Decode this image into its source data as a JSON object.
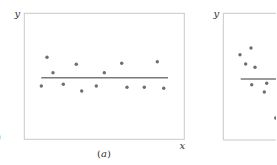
{
  "figure": {
    "panels": [
      {
        "id": "a",
        "caption_open": "(",
        "caption_letter": "a",
        "caption_close": ")",
        "x_axis_label": "x",
        "y_axis_label": "y"
      },
      {
        "id": "b",
        "y_axis_label": "y"
      }
    ],
    "left_edge_fragment": ")"
  },
  "colors": {
    "frame": "#c8c8c8",
    "points": "#6e6e6e",
    "line": "#7a7a7a",
    "text": "#333333"
  },
  "chart_data": [
    {
      "type": "scatter",
      "title": "(a)",
      "xlabel": "x",
      "ylabel": "y",
      "grid": false,
      "ticks": false,
      "description": "Points scattered randomly above and below a horizontal fitted line (no pattern)",
      "points_px": [
        [
          41.3,
          86
        ],
        [
          47,
          57.3
        ],
        [
          53,
          72.7
        ],
        [
          63.3,
          84.3
        ],
        [
          76.3,
          64.3
        ],
        [
          81.7,
          91
        ],
        [
          96.3,
          86
        ],
        [
          104.3,
          72.7
        ],
        [
          121.7,
          63.3
        ],
        [
          127,
          87.3
        ],
        [
          144.3,
          87.3
        ],
        [
          157.3,
          61.7
        ],
        [
          163.7,
          88.3
        ]
      ],
      "line_px": {
        "x1": 41.3,
        "x2": 168,
        "y": 77.7
      },
      "frame_px": {
        "left": 24.3,
        "top": 13.3,
        "right": 184.3,
        "bottom": 139.3
      }
    },
    {
      "type": "scatter",
      "title": "(b)",
      "xlabel": "x",
      "ylabel": "y",
      "grid": false,
      "ticks": false,
      "description": "Points above the line on the left and trending below it toward the right (systematic pattern); panel cropped at right edge",
      "points_px": [
        [
          240,
          54.7
        ],
        [
          251,
          48
        ],
        [
          245.7,
          64
        ],
        [
          255,
          67.3
        ],
        [
          251.7,
          84.7
        ],
        [
          266.7,
          83.3
        ],
        [
          264.3,
          92
        ],
        [
          275.7,
          118
        ]
      ],
      "line_px": {
        "x1": 240.7,
        "x2": 276,
        "y": 79
      },
      "frame_px": {
        "left": 223.3,
        "top": 13.3,
        "right": 276,
        "bottom": 140
      }
    }
  ]
}
